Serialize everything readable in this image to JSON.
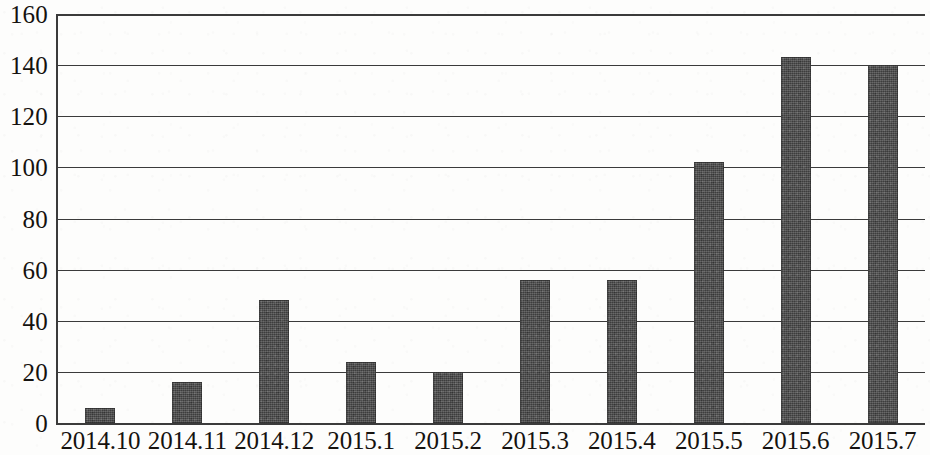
{
  "chart_data": {
    "type": "bar",
    "title": "",
    "subtitle": "",
    "xlabel": "",
    "ylabel": "",
    "categories": [
      "2014.10",
      "2014.11",
      "2014.12",
      "2015.1",
      "2015.2",
      "2015.3",
      "2015.4",
      "2015.5",
      "2015.6",
      "2015.7"
    ],
    "values": [
      6,
      16,
      48,
      24,
      20,
      56,
      56,
      102,
      143,
      140
    ],
    "ylim": [
      0,
      160
    ],
    "ytick_labels": [
      "160",
      "140",
      "120",
      "100",
      "80",
      "60",
      "40",
      "20",
      "0"
    ],
    "ytick_values": [
      160,
      140,
      120,
      100,
      80,
      60,
      40,
      20,
      0
    ],
    "ytick_step": 20,
    "grid": "horizontal",
    "legend": "none",
    "series": [
      {
        "name": "",
        "values": [
          6,
          16,
          48,
          24,
          20,
          56,
          56,
          102,
          143,
          140
        ],
        "color": "#4b4b4b"
      }
    ],
    "annotations": [],
    "colors": {
      "bar_fill": "#4b4b4b",
      "axis": "#3b3b3b",
      "text": "#15120f",
      "background": "#fdfdfc"
    }
  }
}
